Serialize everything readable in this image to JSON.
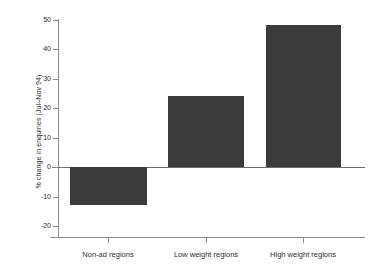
{
  "chart_data": {
    "type": "bar",
    "title": "",
    "subtitle": "",
    "xlabel": "",
    "ylabel": "% change in enquiries (Jul–Nov 94)",
    "categories": [
      "Non-ad regions",
      "Low weight regions",
      "High weight regions"
    ],
    "values": [
      -13,
      24,
      48
    ],
    "ylim": [
      -20,
      50
    ],
    "yticks": [
      50,
      40,
      30,
      20,
      10,
      0,
      -10,
      -20
    ],
    "ytick_labels": [
      "50",
      "40",
      "30",
      "20",
      "10",
      "0",
      "-10",
      "-20"
    ],
    "grid": false,
    "legend": null,
    "bar_color": "#3b3b3b",
    "axis_color": "#8a8a8a",
    "background_color": "#ffffff",
    "annotations": []
  }
}
